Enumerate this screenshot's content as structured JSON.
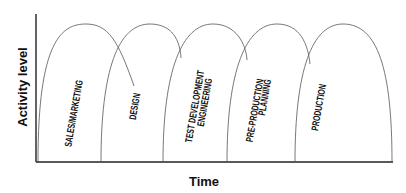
{
  "diagram": {
    "x_axis_label": "Time",
    "y_axis_label": "Activity level",
    "phases": [
      {
        "label_lines": [
          "SALES/MARKETING"
        ]
      },
      {
        "label_lines": [
          "DESIGN"
        ]
      },
      {
        "label_lines": [
          "TEST DEVELOPMENT",
          "ENGINEERING"
        ]
      },
      {
        "label_lines": [
          "PRE-PRODUCTION",
          "PLANNING"
        ]
      },
      {
        "label_lines": [
          "PRODUCTION"
        ]
      }
    ]
  }
}
